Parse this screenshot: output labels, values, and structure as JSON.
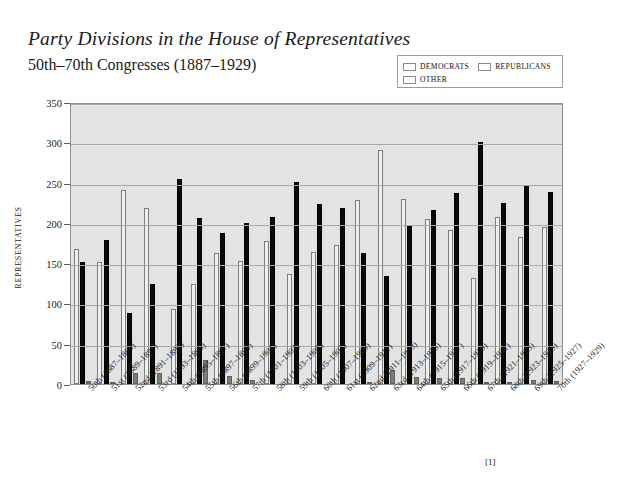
{
  "header": {
    "title": "Party Divisions in the House of Representatives",
    "subtitle": "50th–70th Congresses (1887–1929)"
  },
  "legend": {
    "position": "top-right",
    "items": [
      {
        "label": "Democrats",
        "color": "#efefef",
        "key": "democrats"
      },
      {
        "label": "Republicans",
        "color": "#0a0a0a",
        "key": "republicans"
      },
      {
        "label": "Other",
        "color": "#7d7d7d",
        "key": "other"
      }
    ]
  },
  "footnote": "[1]",
  "chart_data": {
    "type": "bar",
    "title": "Party Divisions in the House of Representatives",
    "subtitle": "50th–70th Congresses (1887–1929)",
    "xlabel": "",
    "ylabel": "Representatives",
    "ylim": [
      0,
      350
    ],
    "yticks": [
      0,
      50,
      100,
      150,
      200,
      250,
      300,
      350
    ],
    "grid": true,
    "legend_position": "top-right",
    "categories": [
      "50th (1887–1889)",
      "51st (1889–1891)",
      "52nd (1891–1893)",
      "53rd (1891–1893)",
      "54th (1893–1895)",
      "55th (1897–1899)",
      "56th (1897–1899)",
      "57th (1899–1901)",
      "58th (1901–1903)",
      "59th (1903–1905)",
      "60th (1905–1907)",
      "61st (1907–1909)",
      "62nd (1909–1911)",
      "63rd (1911–1913)",
      "64th (1913–1915)",
      "65th (1915–1917)",
      "66th (1917–1919)",
      "67th (1919–1921)",
      "68th (1921–1923)",
      "69th (1923–1925)",
      "70th (1925–1927)"
    ],
    "xtick_labels": [
      "50th (1887–1889)",
      "51st (1889–1891)",
      "52nd (1891–1893)",
      "53rd (1893–1895)",
      "54th (1895–1897)",
      "55th (1897–1899)",
      "56th (1899–1901)",
      "57th (1901–1903)",
      "58th (1903–1905)",
      "59th (1905–1907)",
      "60th (1907–1909)",
      "61st (1909–1911)",
      "62nd (1911–1913)",
      "63rd (1913–1915)",
      "64th (1915–1917)",
      "65th (1917–1919)",
      "66th (1919–1921)",
      "67th (1921–1923)",
      "68th (1923–1925)",
      "69th (1925–1927)",
      "70th (1927–1929)"
    ],
    "series": [
      {
        "name": "Democrats",
        "color": "#efefef",
        "values": [
          167,
          152,
          241,
          218,
          93,
          124,
          163,
          153,
          178,
          136,
          164,
          172,
          228,
          291,
          230,
          205,
          191,
          132,
          207,
          183,
          195
        ]
      },
      {
        "name": "Republicans",
        "color": "#0a0a0a",
        "values": [
          152,
          179,
          88,
          124,
          254,
          206,
          187,
          200,
          207,
          251,
          223,
          219,
          162,
          134,
          196,
          216,
          237,
          300,
          225,
          247,
          238
        ]
      },
      {
        "name": "Other",
        "color": "#7d7d7d",
        "values": [
          4,
          1,
          14,
          14,
          0,
          30,
          10,
          5,
          0,
          0,
          0,
          0,
          1,
          18,
          9,
          8,
          7,
          2,
          3,
          5,
          4
        ]
      }
    ]
  }
}
